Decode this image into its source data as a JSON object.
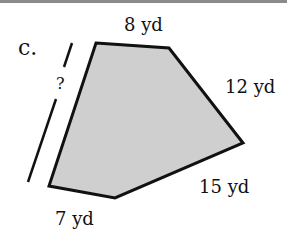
{
  "problem": {
    "label": "c.",
    "unknown": "?",
    "sides": {
      "top": "8 yd",
      "upper_right": "12 yd",
      "lower_right": "15 yd",
      "bottom": "7 yd"
    }
  },
  "colors": {
    "fill": "#cfcfcf",
    "stroke": "#111111",
    "topbar": "#8a8a8a"
  }
}
